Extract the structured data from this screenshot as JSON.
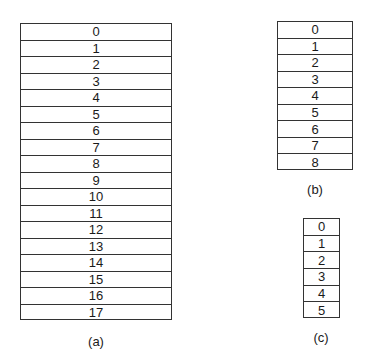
{
  "diagram": {
    "panels": [
      {
        "id": "a",
        "caption": "(a)",
        "cells": [
          "0",
          "1",
          "2",
          "3",
          "4",
          "5",
          "6",
          "7",
          "8",
          "9",
          "10",
          "11",
          "12",
          "13",
          "14",
          "15",
          "16",
          "17"
        ]
      },
      {
        "id": "b",
        "caption": "(b)",
        "cells": [
          "0",
          "1",
          "2",
          "3",
          "4",
          "5",
          "6",
          "7",
          "8"
        ]
      },
      {
        "id": "c",
        "caption": "(c)",
        "cells": [
          "0",
          "1",
          "2",
          "3",
          "4",
          "5"
        ]
      }
    ]
  }
}
